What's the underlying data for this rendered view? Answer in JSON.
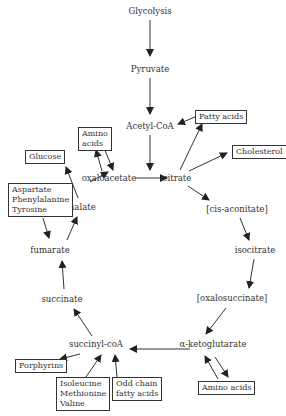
{
  "nodes": {
    "glycolysis": "Glycolysis",
    "pyruvate": "Pyruvate",
    "acetyl_coa": "Acetyl-CoA",
    "oxaloacetate": "oxaloacetate",
    "citrate": "citrate",
    "cis_aconitate": "[cis-aconitate]",
    "isocitrate": "isocitrate",
    "oxalosuccinate": "[oxalosuccinate]",
    "alpha_ketoglutarate": "α-ketoglutarate",
    "succinyl_coa": "succinyl-coA",
    "succinate": "succinate",
    "fumarate": "fumarate",
    "malate": "malate"
  },
  "boxes": {
    "fatty_acids": "Fatty acids",
    "cholesterol": "Cholesterol",
    "amino_acids_top": "Amino\nacids",
    "glucose": "Glucose",
    "aspartate_group": "Aspartate\nPhenylalanine\nTyrosine",
    "porphyrins": "Porphyrins",
    "isoleucine_group": "Isoleucine\nMethionine\nValine",
    "odd_chain": "Odd chain\nfatty acids",
    "amino_acids_bottom": "Amino acids"
  }
}
